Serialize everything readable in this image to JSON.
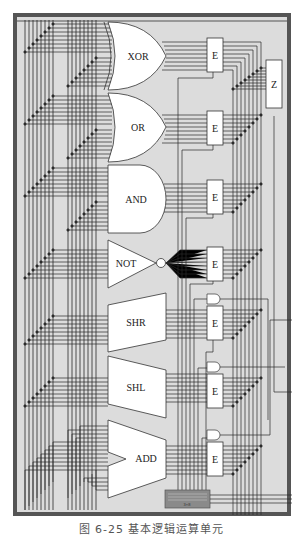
{
  "figure": {
    "caption": "图 6-25   基本逻辑运算单元",
    "colors": {
      "frame": "#555555",
      "panel": "#dcdcdc",
      "wire": "#2a2a2a",
      "gate_fill": "#ffffff",
      "decoder_fill": "#8a8a8a"
    }
  },
  "units": [
    {
      "label": "XOR",
      "shape": "xor-gate"
    },
    {
      "label": "OR",
      "shape": "or-gate"
    },
    {
      "label": "AND",
      "shape": "and-gate"
    },
    {
      "label": "NOT",
      "shape": "not-gate"
    },
    {
      "label": "SHR",
      "shape": "shifter"
    },
    {
      "label": "SHL",
      "shape": "shifter"
    },
    {
      "label": "ADD",
      "shape": "adder"
    }
  ],
  "enablers": [
    {
      "label": "E"
    },
    {
      "label": "E"
    },
    {
      "label": "E"
    },
    {
      "label": "E"
    },
    {
      "label": "E"
    },
    {
      "label": "E"
    },
    {
      "label": "E"
    }
  ],
  "zero_box": {
    "label": "Z"
  },
  "decoder": {
    "label": "3×8"
  }
}
